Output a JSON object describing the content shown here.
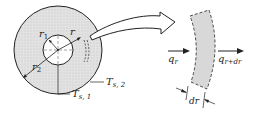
{
  "figure": {
    "labels": {
      "r1": "r",
      "r1_sub": "1",
      "r": "r",
      "r2": "r",
      "r2_sub": "2",
      "Ts2": "T",
      "Ts2_sub": "s, 2",
      "Ts1": "T",
      "Ts1_sub": "s, 1",
      "qr": "q",
      "qr_sub": "r",
      "qrdr": "q",
      "qrdr_sub": "r+dr",
      "dr": "dr"
    },
    "colors": {
      "fill": "#dcdcdc",
      "stroke": "#222222",
      "background": "#ffffff"
    }
  }
}
